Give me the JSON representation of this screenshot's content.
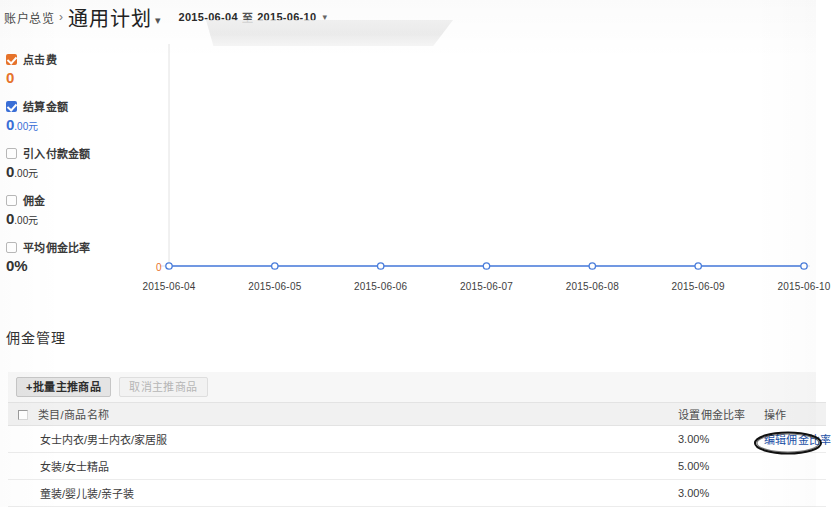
{
  "header": {
    "breadcrumb_root": "账户总览",
    "breadcrumb_separator": "›",
    "breadcrumb_current": "通用计划",
    "breadcrumb_caret": "▾",
    "date_start": "2015-06-04",
    "date_separator": "至",
    "date_end": "2015-06-10",
    "date_caret": "▾"
  },
  "metrics": [
    {
      "label": "点击费",
      "value": "0",
      "unit": "",
      "checked": true,
      "color": "#e8732a"
    },
    {
      "label": "结算金额",
      "value": "0",
      "unit": ".00元",
      "checked": true,
      "color": "#3a6fd8"
    },
    {
      "label": "引入付款金额",
      "value": "0",
      "unit": ".00元",
      "checked": false,
      "color": "#333333"
    },
    {
      "label": "佣金",
      "value": "0",
      "unit": ".00元",
      "checked": false,
      "color": "#333333"
    },
    {
      "label": "平均佣金比率",
      "value": "0%",
      "unit": "",
      "checked": false,
      "color": "#333333"
    }
  ],
  "chart_data": {
    "type": "line",
    "title": "",
    "xlabel": "",
    "ylabel": "",
    "grid": false,
    "legend": "left",
    "y_zero_label": "0",
    "y_zero_color": "#e8732a",
    "line_color": "#4a7ddb",
    "marker_color": "#ffffff",
    "categories": [
      "2015-06-04",
      "2015-06-05",
      "2015-06-06",
      "2015-06-07",
      "2015-06-08",
      "2015-06-09",
      "2015-06-10"
    ],
    "x": [
      "2015-06-04",
      "2015-06-05",
      "2015-06-06",
      "2015-06-07",
      "2015-06-08",
      "2015-06-09",
      "2015-06-10"
    ],
    "ylim": [
      0,
      1
    ],
    "series": [
      {
        "name": "结算金额",
        "color": "#4a7ddb",
        "values": [
          0,
          0,
          0,
          0,
          0,
          0,
          0
        ]
      }
    ]
  },
  "commission": {
    "section_title": "佣金管理",
    "toolbar": {
      "add_button": "+批量主推商品",
      "secondary_button": "取消主推商品"
    },
    "table": {
      "headers": {
        "name": "类目/商品名称",
        "rate": "设置佣金比率",
        "action": "操作"
      },
      "rows": [
        {
          "name": "女士内衣/男士内衣/家居服",
          "rate": "3.00%",
          "action": "编辑佣金比率"
        },
        {
          "name": "女装/女士精品",
          "rate": "5.00%",
          "action": ""
        },
        {
          "name": "童装/婴儿装/亲子装",
          "rate": "3.00%",
          "action": ""
        }
      ]
    }
  },
  "annotation": {
    "shape": "hand-drawn-ellipse",
    "color": "#111111",
    "targets": "编辑佣金比率"
  }
}
